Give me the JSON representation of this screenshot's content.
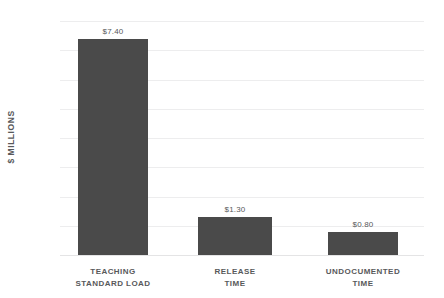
{
  "chart_data": {
    "type": "bar",
    "title": "",
    "subtitle": "",
    "xlabel": "",
    "ylabel": "$ MILLIONS",
    "categories": [
      "TEACHING STANDARD LOAD",
      "RELEASE TIME",
      "UNDOCUMENTED TIME"
    ],
    "category_lines": [
      [
        "TEACHING",
        "STANDARD LOAD"
      ],
      [
        "RELEASE",
        "TIME"
      ],
      [
        "UNDOCUMENTED",
        "TIME"
      ]
    ],
    "values": [
      7.4,
      1.3,
      0.8
    ],
    "value_labels": [
      "$7.40",
      "$1.30",
      "$0.80"
    ],
    "ylim": [
      0,
      8
    ],
    "ytick_values": [
      8,
      7,
      6,
      5,
      4,
      3,
      2,
      1,
      0
    ],
    "ytick_labels": [
      "$8",
      "$7",
      "$6",
      "$5",
      "$4",
      "$3",
      "$2",
      "$1",
      "$0"
    ],
    "grid": true,
    "legend": false,
    "legend_position": "none",
    "bar_color": "#4a4a4a",
    "gridline_color": "#ededee",
    "tick_label_color": "#a7a9ac",
    "text_color": "#58595b",
    "background_color": "#ffffff"
  }
}
